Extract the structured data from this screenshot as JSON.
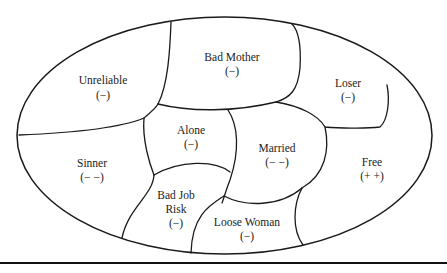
{
  "diagram": {
    "type": "ellipse partitioned into labeled regions",
    "regions": [
      {
        "id": "unreliable",
        "lines": [
          "Unreliable",
          "(−)"
        ]
      },
      {
        "id": "bad-mother",
        "lines": [
          "Bad Mother",
          "(−)"
        ]
      },
      {
        "id": "loser",
        "lines": [
          "Loser",
          "(−)"
        ]
      },
      {
        "id": "alone",
        "lines": [
          "Alone",
          "(−)"
        ]
      },
      {
        "id": "married",
        "lines": [
          "Married",
          "(− −)"
        ]
      },
      {
        "id": "sinner",
        "lines": [
          "Sinner",
          "(− −)"
        ]
      },
      {
        "id": "free",
        "lines": [
          "Free",
          "(+ +)"
        ]
      },
      {
        "id": "bad-job-risk",
        "lines": [
          "Bad Job",
          "Risk",
          "(−)"
        ]
      },
      {
        "id": "loose-woman",
        "lines": [
          "Loose Woman",
          "(−)"
        ]
      }
    ]
  }
}
